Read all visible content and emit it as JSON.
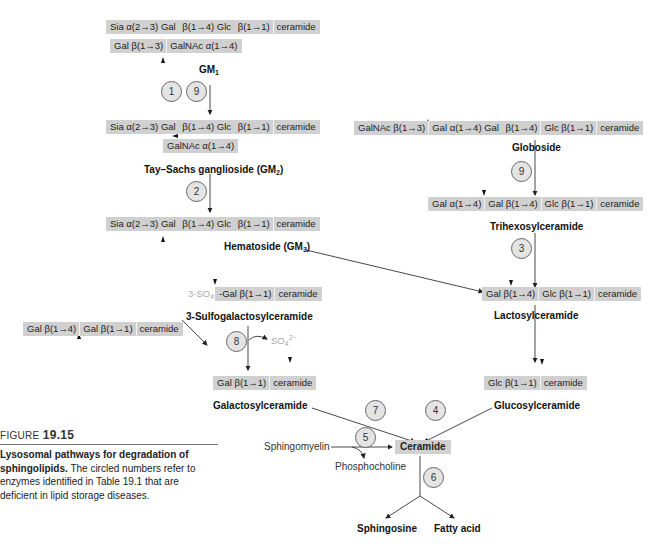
{
  "figure": {
    "number_prefix": "FIGURE",
    "number": "19.15",
    "caption_bold": "Lysosomal pathways for degradation of sphingolipids.",
    "caption_text": "The circled numbers refer to enzymes identified in Table 19.1 that are deficient in lipid storage diseases."
  },
  "molecules": {
    "gm1": {
      "main_chain": [
        "Sia α(2→3) Gal",
        "β(1→4) Glc",
        "β(1→1)",
        "ceramide"
      ],
      "branch": [
        "Gal β(1→3)",
        "GalNAc α(1→4)"
      ],
      "name": "GM",
      "name_sub": "1"
    },
    "gm2": {
      "main_chain": [
        "Sia α(2→3) Gal",
        "β(1→4) Glc",
        "β(1→1)",
        "ceramide"
      ],
      "branch": [
        "GalNAc α(1→4)"
      ],
      "name": "Tay–Sachs ganglioside (GM",
      "name_sub": "2",
      "name_end": ")"
    },
    "gm3": {
      "main_chain": [
        "Sia α(2→3) Gal",
        "β(1→4) Glc",
        "β(1→1)",
        "ceramide"
      ],
      "name": "Hematoside (GM",
      "name_sub": "3",
      "name_end": ")"
    },
    "globoside": {
      "chain": [
        "GalNAc β(1→3)",
        "Gal α(1→4) Gal",
        "β(1→4)",
        "Glc β(1→1)",
        "ceramide"
      ],
      "name": "Globoside"
    },
    "trihexosylceramide": {
      "chain": [
        "Gal α(1→4)",
        "Gal β(1→4)",
        "Glc β(1→1)",
        "ceramide"
      ],
      "name": "Trihexosylceramide"
    },
    "lactosylceramide": {
      "chain": [
        "Gal β(1→4)",
        "Glc β(1→1)",
        "ceramide"
      ],
      "name": "Lactosylceramide"
    },
    "sulfogalactosylceramide": {
      "prefix": "3-SO",
      "prefix_sub": "4",
      "chain": [
        "-Gal β(1→1)",
        "ceramide"
      ],
      "name": "3-Sulfogalactosylceramide"
    },
    "digalactosylceramide": {
      "chain": [
        "Gal β(1→4)",
        "Gal β(1→1)",
        "ceramide"
      ]
    },
    "galactosylceramide": {
      "chain": [
        "Gal β(1→1)",
        "ceramide"
      ],
      "name": "Galactosylceramide"
    },
    "glucosylceramide": {
      "chain": [
        "Glc β(1→1)",
        "ceramide"
      ],
      "name": "Glucosylceramide"
    },
    "ceramide": {
      "name": "Ceramide"
    },
    "sphingomyelin": {
      "name": "Sphingomyelin"
    },
    "phosphocholine": {
      "name": "Phosphocholine"
    },
    "sulfate": {
      "text": "SO",
      "sub": "4",
      "sup": "2−"
    },
    "sphingosine": {
      "name": "Sphingosine"
    },
    "fatty_acid": {
      "name": "Fatty acid"
    }
  },
  "enzymes": {
    "e1": "1",
    "e9a": "9",
    "e2": "2",
    "e9b": "9",
    "e3": "3",
    "e8": "8",
    "e7": "7",
    "e4": "4",
    "e5": "5",
    "e6": "6"
  }
}
